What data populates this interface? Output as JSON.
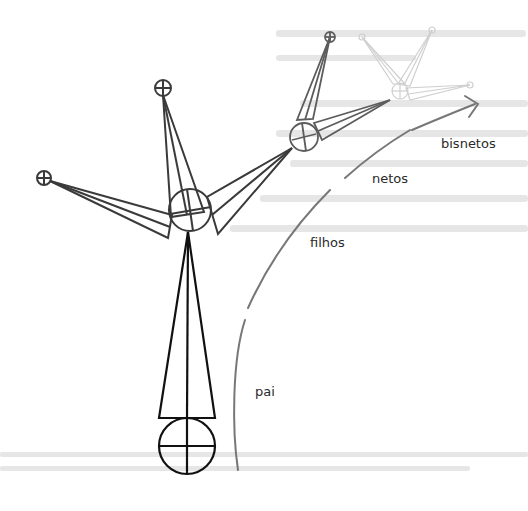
{
  "diagram": {
    "generations": [
      {
        "id": "pai",
        "label": "pai",
        "level": 0,
        "shade": "#111111"
      },
      {
        "id": "filhos",
        "label": "filhos",
        "level": 1,
        "shade": "#3a3a3a"
      },
      {
        "id": "netos",
        "label": "netos",
        "level": 2,
        "shade": "#6e6e6e"
      },
      {
        "id": "bisnetos",
        "label": "bisnetos",
        "level": 3,
        "shade": "#c8c8c8"
      }
    ],
    "arrow": {
      "direction": "forward",
      "meaning": "sucessão das gerações",
      "color": "#666666"
    },
    "nodes": {
      "pai": {
        "children": 1
      },
      "filhos": {
        "children": 3
      },
      "netos": {
        "children": 3
      },
      "bisnetos": {
        "children": 3
      }
    },
    "background": {
      "bleed_through_text": true,
      "legible": false
    }
  }
}
